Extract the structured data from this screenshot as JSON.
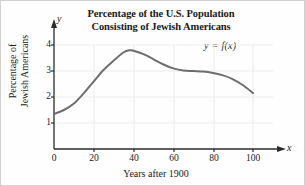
{
  "chart_data": {
    "type": "line",
    "title": "Percentage of the U.S. Population Consisting of Jewish Americans",
    "title_line1": "Percentage of the U.S. Population",
    "title_line2": "Consisting of Jewish Americans",
    "annotation": "y = f(x)",
    "xlabel": "Years after 1900",
    "ylabel": "Percentage of Jewish Americans",
    "ylabel_line1": "Percentage of",
    "ylabel_line2": "Jewish Americans",
    "x_axis_letter": "x",
    "y_axis_letter": "y",
    "xlim": [
      0,
      108
    ],
    "ylim": [
      0,
      4.4
    ],
    "xticks": [
      0,
      20,
      40,
      60,
      80,
      100
    ],
    "xtick_labels": [
      "0",
      "20",
      "40",
      "60",
      "80",
      "100"
    ],
    "yticks": [
      1,
      2,
      3,
      4
    ],
    "ytick_labels": [
      "1",
      "2",
      "3",
      "4"
    ],
    "grid": true,
    "legend": "none",
    "series": [
      {
        "name": "y = f(x)",
        "color": "#6e6e6e",
        "x": [
          0,
          5,
          10,
          15,
          20,
          25,
          30,
          35,
          38,
          40,
          45,
          50,
          55,
          60,
          65,
          70,
          75,
          80,
          85,
          90,
          95,
          100
        ],
        "y": [
          1.35,
          1.5,
          1.75,
          2.15,
          2.6,
          3.05,
          3.4,
          3.72,
          3.8,
          3.78,
          3.65,
          3.45,
          3.25,
          3.1,
          3.02,
          3.0,
          2.98,
          2.92,
          2.83,
          2.68,
          2.45,
          2.15
        ]
      }
    ]
  },
  "colors": {
    "curve": "#6e6e6e",
    "axis": "#2b2b2b",
    "grid": "#ececec",
    "border": "#d0d0d0"
  }
}
